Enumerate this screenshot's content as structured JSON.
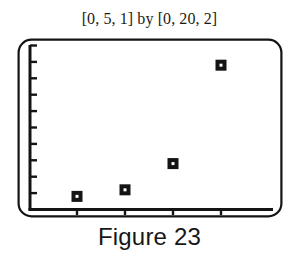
{
  "figure": {
    "range_title": "[0, 5, 1] by [0, 20, 2]",
    "caption": "Figure 23",
    "ink_color": "#141414",
    "screen_background": "#ffffff"
  },
  "chart_data": {
    "type": "scatter",
    "title": "[0, 5, 1] by [0, 20, 2]",
    "subtitle": "Figure 23",
    "xlabel": "",
    "ylabel": "",
    "xlim": [
      0,
      5
    ],
    "ylim": [
      0,
      20
    ],
    "xtick_step": 1,
    "ytick_step": 2,
    "xticks": [
      1,
      2,
      3,
      4
    ],
    "yticks": [
      2,
      4,
      6,
      8,
      10,
      12,
      14,
      16,
      18,
      20
    ],
    "grid": false,
    "legend": "none",
    "marker": "square-open-center",
    "series": [
      {
        "name": "data",
        "points": [
          {
            "x": 1,
            "y": 1.6
          },
          {
            "x": 2,
            "y": 2.4
          },
          {
            "x": 3,
            "y": 5.6
          },
          {
            "x": 4,
            "y": 17.6
          }
        ]
      }
    ]
  }
}
